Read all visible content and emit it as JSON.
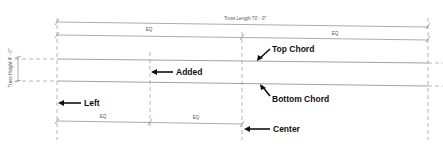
{
  "diagram": {
    "dimensions": {
      "truss_length": "Truss Length 70' - 0\"",
      "truss_height": "Truss Height 4' - 0\"",
      "top_eq_left": "EQ",
      "top_eq_right": "EQ",
      "bottom_eq_left": "EQ",
      "bottom_eq_right": "EQ"
    },
    "callouts": {
      "top_chord": "Top Chord",
      "bottom_chord": "Bottom Chord",
      "added": "Added",
      "left": "Left",
      "center": "Center"
    },
    "colors": {
      "line": "#8a8a8a",
      "text": "#111111",
      "background": "#ffffff"
    }
  }
}
